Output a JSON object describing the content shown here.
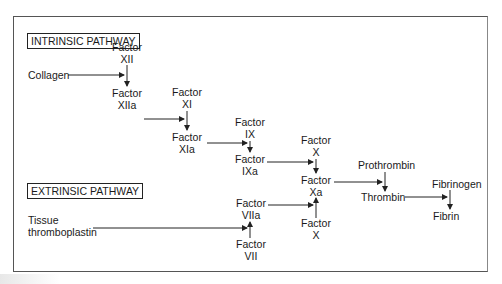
{
  "diagram": {
    "intrinsic_label": "INTRINSIC PATHWAY",
    "extrinsic_label": "EXTRINSIC PATHWAY",
    "nodes": {
      "factor_xii": [
        "Factor",
        "XII"
      ],
      "collagen": "Collagen",
      "factor_xiia": [
        "Factor",
        "XIIa"
      ],
      "factor_xi": [
        "Factor",
        "XI"
      ],
      "factor_xia": [
        "Factor",
        "XIa"
      ],
      "factor_ix": [
        "Factor",
        "IX"
      ],
      "factor_ixa": [
        "Factor",
        "IXa"
      ],
      "factor_x_top": [
        "Factor",
        "X"
      ],
      "factor_xa": [
        "Factor",
        "Xa"
      ],
      "factor_viia": [
        "Factor",
        "VIIa"
      ],
      "factor_vii": [
        "Factor",
        "VII"
      ],
      "factor_x_bottom": [
        "Factor",
        "X"
      ],
      "tissue_thromboplastin": [
        "Tissue",
        "thromboplastin"
      ],
      "prothrombin": "Prothrombin",
      "thrombin": "Thrombin",
      "fibrinogen": "Fibrinogen",
      "fibrin": "Fibrin"
    },
    "edges": [
      {
        "from": "Collagen",
        "to": "Factor XII → XIIa"
      },
      {
        "from": "Factor XII",
        "to": "Factor XIIa"
      },
      {
        "from": "Factor XIIa",
        "to": "Factor XI → XIa"
      },
      {
        "from": "Factor XI",
        "to": "Factor XIa"
      },
      {
        "from": "Factor XIa",
        "to": "Factor IX → IXa"
      },
      {
        "from": "Factor IX",
        "to": "Factor IXa"
      },
      {
        "from": "Factor IXa",
        "to": "Factor X → Xa"
      },
      {
        "from": "Factor X",
        "to": "Factor Xa"
      },
      {
        "from": "Tissue thromboplastin",
        "to": "Factor VII → VIIa"
      },
      {
        "from": "Factor VII",
        "to": "Factor VIIa"
      },
      {
        "from": "Factor VIIa",
        "to": "Factor X → Xa"
      },
      {
        "from": "Factor X (bottom)",
        "to": "Factor Xa"
      },
      {
        "from": "Factor Xa",
        "to": "Prothrombin → Thrombin"
      },
      {
        "from": "Prothrombin",
        "to": "Thrombin"
      },
      {
        "from": "Thrombin",
        "to": "Fibrinogen → Fibrin"
      },
      {
        "from": "Fibrinogen",
        "to": "Fibrin"
      }
    ],
    "colors": {
      "stroke": "#222222",
      "text": "#1a1a1a",
      "frame": "#555555"
    }
  }
}
